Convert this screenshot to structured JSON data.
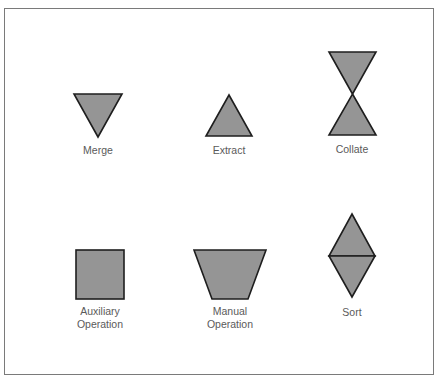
{
  "diagram": {
    "title": "",
    "colors": {
      "shape_fill": "#959595",
      "shape_stroke": "#1e1e1e",
      "label_text": "#5a5a5a",
      "frame": "#7a7a7a"
    },
    "symbols": [
      {
        "id": "merge",
        "shape": "inverted-triangle",
        "label": "Merge"
      },
      {
        "id": "extract",
        "shape": "triangle",
        "label": "Extract"
      },
      {
        "id": "collate",
        "shape": "hourglass",
        "label": "Collate"
      },
      {
        "id": "auxiliary-operation",
        "shape": "square",
        "label": "Auxiliary\nOperation"
      },
      {
        "id": "manual-operation",
        "shape": "trapezoid",
        "label": "Manual\nOperation"
      },
      {
        "id": "sort",
        "shape": "diamond-split",
        "label": "Sort"
      }
    ]
  }
}
